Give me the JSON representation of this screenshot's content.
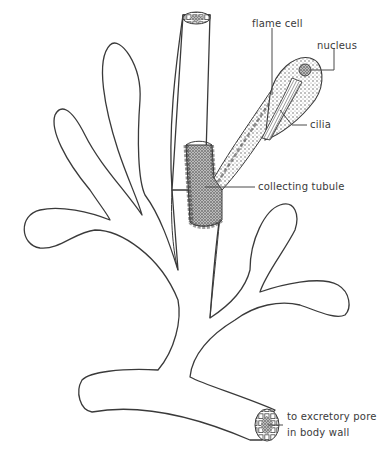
{
  "diagram": {
    "colors": {
      "background": "#ffffff",
      "line": "#3a3a3a",
      "stipple": "#6a6a6a"
    },
    "labels": {
      "flame_cell": "flame cell",
      "nucleus": "nucleus",
      "cilia": "cilia",
      "collecting_tubule": "collecting tubule",
      "excretory_pore_line1": "to excretory pore",
      "excretory_pore_line2": "in body wall"
    }
  }
}
